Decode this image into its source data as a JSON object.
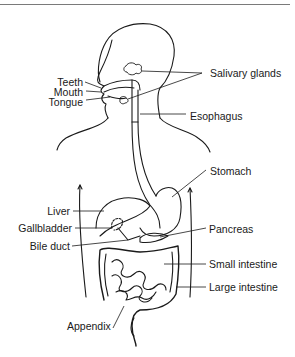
{
  "diagram": {
    "type": "anatomy-labeled-illustration",
    "labels": {
      "salivary_glands": "Salivary glands",
      "teeth": "Teeth",
      "mouth": "Mouth",
      "tongue": "Tongue",
      "esophagus": "Esophagus",
      "stomach": "Stomach",
      "liver": "Liver",
      "gallbladder": "Gallbladder",
      "bile_duct": "Bile duct",
      "pancreas": "Pancreas",
      "small_intestine": "Small intestine",
      "large_intestine": "Large intestine",
      "appendix": "Appendix"
    },
    "colors": {
      "line": "#1a1a1a",
      "background": "#ffffff",
      "rule": "#7a7a7a"
    }
  }
}
